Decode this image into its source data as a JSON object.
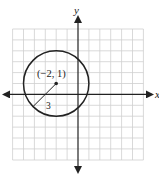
{
  "diagram": {
    "type": "coordinate-plane-circle",
    "axes": {
      "x_label": "x",
      "y_label": "y"
    },
    "grid": {
      "x_min": -6,
      "x_max": 6,
      "y_min": -6,
      "y_max": 6,
      "unit_px": 10.9
    },
    "circle": {
      "center_label": "(−2, 1)",
      "center": [
        -2,
        1
      ],
      "radius": 3,
      "radius_label": "3"
    },
    "colors": {
      "grid": "#c8c8c8",
      "axis": "#222222",
      "circle": "#222222"
    }
  }
}
